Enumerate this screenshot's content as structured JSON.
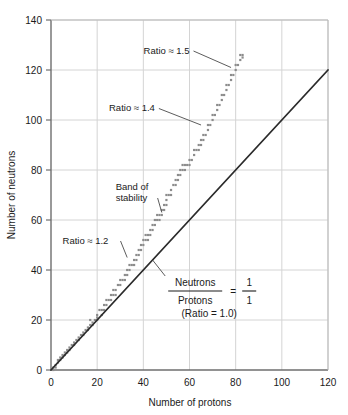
{
  "chart_data": {
    "type": "scatter",
    "title": "",
    "xlabel": "Number of protons",
    "ylabel": "Number of neutrons",
    "xlim": [
      0,
      120
    ],
    "ylim": [
      0,
      140
    ],
    "xticks": [
      0,
      20,
      40,
      60,
      80,
      100,
      120
    ],
    "yticks": [
      0,
      20,
      40,
      60,
      80,
      100,
      120,
      140
    ],
    "grid": true,
    "legend": "none",
    "colors": {
      "band": "#8c8c8c",
      "reference_line": "#2b2b2b",
      "grid": "#d4d4d4",
      "axis": "#6e6e6e",
      "background": "#ffffff",
      "text": "#1a1a1a"
    },
    "series": [
      {
        "name": "Band of stability",
        "type": "scatter",
        "marker": "square",
        "color": "#8c8c8c",
        "points": [
          [
            1,
            0
          ],
          [
            1,
            1
          ],
          [
            2,
            1
          ],
          [
            2,
            2
          ],
          [
            3,
            3
          ],
          [
            3,
            4
          ],
          [
            4,
            4
          ],
          [
            4,
            5
          ],
          [
            5,
            5
          ],
          [
            5,
            6
          ],
          [
            6,
            6
          ],
          [
            6,
            7
          ],
          [
            7,
            7
          ],
          [
            7,
            8
          ],
          [
            8,
            8
          ],
          [
            8,
            9
          ],
          [
            9,
            10
          ],
          [
            10,
            10
          ],
          [
            10,
            11
          ],
          [
            11,
            12
          ],
          [
            12,
            12
          ],
          [
            12,
            13
          ],
          [
            13,
            14
          ],
          [
            14,
            14
          ],
          [
            14,
            15
          ],
          [
            15,
            16
          ],
          [
            16,
            16
          ],
          [
            16,
            17
          ],
          [
            17,
            18
          ],
          [
            17,
            20
          ],
          [
            18,
            18
          ],
          [
            18,
            19
          ],
          [
            19,
            20
          ],
          [
            20,
            20
          ],
          [
            20,
            21
          ],
          [
            20,
            22
          ],
          [
            21,
            24
          ],
          [
            22,
            22
          ],
          [
            22,
            24
          ],
          [
            23,
            24
          ],
          [
            23,
            26
          ],
          [
            24,
            26
          ],
          [
            24,
            28
          ],
          [
            25,
            28
          ],
          [
            26,
            28
          ],
          [
            26,
            30
          ],
          [
            27,
            30
          ],
          [
            27,
            32
          ],
          [
            28,
            30
          ],
          [
            28,
            32
          ],
          [
            29,
            34
          ],
          [
            30,
            34
          ],
          [
            30,
            36
          ],
          [
            31,
            36
          ],
          [
            32,
            36
          ],
          [
            32,
            38
          ],
          [
            33,
            38
          ],
          [
            33,
            40
          ],
          [
            34,
            40
          ],
          [
            34,
            42
          ],
          [
            35,
            42
          ],
          [
            36,
            42
          ],
          [
            36,
            44
          ],
          [
            37,
            44
          ],
          [
            37,
            46
          ],
          [
            38,
            46
          ],
          [
            38,
            48
          ],
          [
            39,
            48
          ],
          [
            39,
            50
          ],
          [
            40,
            50
          ],
          [
            40,
            52
          ],
          [
            41,
            52
          ],
          [
            41,
            54
          ],
          [
            42,
            52
          ],
          [
            42,
            54
          ],
          [
            43,
            54
          ],
          [
            43,
            56
          ],
          [
            44,
            56
          ],
          [
            44,
            58
          ],
          [
            45,
            58
          ],
          [
            45,
            60
          ],
          [
            46,
            60
          ],
          [
            46,
            62
          ],
          [
            47,
            60
          ],
          [
            47,
            62
          ],
          [
            48,
            62
          ],
          [
            48,
            64
          ],
          [
            49,
            64
          ],
          [
            49,
            66
          ],
          [
            50,
            66
          ],
          [
            50,
            68
          ],
          [
            50,
            70
          ],
          [
            51,
            70
          ],
          [
            52,
            70
          ],
          [
            52,
            72
          ],
          [
            53,
            74
          ],
          [
            54,
            74
          ],
          [
            54,
            76
          ],
          [
            55,
            76
          ],
          [
            55,
            78
          ],
          [
            56,
            78
          ],
          [
            56,
            80
          ],
          [
            57,
            80
          ],
          [
            57,
            82
          ],
          [
            58,
            80
          ],
          [
            58,
            82
          ],
          [
            59,
            82
          ],
          [
            60,
            82
          ],
          [
            60,
            84
          ],
          [
            61,
            84
          ],
          [
            62,
            86
          ],
          [
            62,
            88
          ],
          [
            63,
            88
          ],
          [
            64,
            88
          ],
          [
            64,
            90
          ],
          [
            65,
            90
          ],
          [
            65,
            92
          ],
          [
            66,
            92
          ],
          [
            66,
            94
          ],
          [
            67,
            94
          ],
          [
            68,
            96
          ],
          [
            68,
            98
          ],
          [
            69,
            98
          ],
          [
            70,
            100
          ],
          [
            70,
            102
          ],
          [
            71,
            102
          ],
          [
            72,
            104
          ],
          [
            72,
            106
          ],
          [
            73,
            106
          ],
          [
            74,
            108
          ],
          [
            74,
            110
          ],
          [
            75,
            110
          ],
          [
            76,
            112
          ],
          [
            76,
            114
          ],
          [
            77,
            114
          ],
          [
            78,
            116
          ],
          [
            78,
            118
          ],
          [
            79,
            118
          ],
          [
            80,
            120
          ],
          [
            80,
            122
          ],
          [
            81,
            122
          ],
          [
            82,
            124
          ],
          [
            82,
            126
          ],
          [
            83,
            125
          ],
          [
            83,
            126
          ]
        ]
      },
      {
        "name": "Neutrons/Protons = 1/1",
        "type": "line",
        "color": "#2b2b2b",
        "points": [
          [
            0,
            0
          ],
          [
            120,
            120
          ]
        ]
      }
    ],
    "annotations": [
      {
        "id": "ratio-15",
        "text": "Ratio ≈ 1.5",
        "text_xy": [
          60,
          128
        ],
        "target_xy": [
          78,
          121
        ]
      },
      {
        "id": "ratio-14",
        "text": "Ratio ≈ 1.4",
        "text_xy": [
          45,
          105
        ],
        "target_xy": [
          65,
          98
        ]
      },
      {
        "id": "band-of-stability",
        "text_line1": "Band of",
        "text_line2": "stability",
        "text_xy": [
          28,
          72
        ],
        "target_xy": [
          48,
          63
        ]
      },
      {
        "id": "ratio-12",
        "text": "Ratio ≈ 1.2",
        "text_xy": [
          5,
          52
        ],
        "target_xy": [
          33,
          45
        ]
      },
      {
        "id": "ratio-10",
        "numerator": "Neutrons",
        "denominator": "Protons",
        "equals": "=",
        "frac_numerator": "1",
        "frac_denominator": "1",
        "sub_text": "(Ratio = 1.0)",
        "text_xy": [
          72,
          32
        ],
        "target_xy": [
          44,
          44
        ]
      }
    ]
  }
}
